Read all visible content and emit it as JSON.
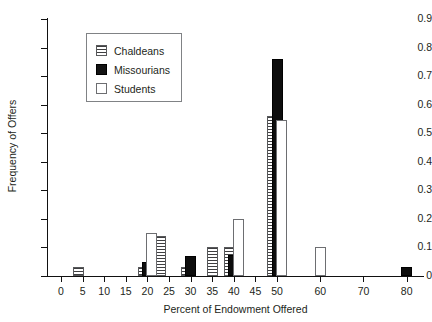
{
  "chart_data": {
    "type": "bar",
    "title": "",
    "subtitle": "",
    "xlabel": "Percent of Endowment Offered",
    "ylabel": "Frequency of Offers",
    "xlim": [
      -3,
      84
    ],
    "ylim": [
      0,
      0.9
    ],
    "grid": false,
    "legend_position": "upper-left-inside",
    "xticks": [
      0,
      5,
      10,
      15,
      20,
      25,
      30,
      35,
      40,
      45,
      50,
      60,
      70,
      80
    ],
    "xtick_labels": [
      "0",
      "5",
      "10",
      "15",
      "20",
      "25",
      "30",
      "35",
      "40",
      "45",
      "50",
      "60",
      "70",
      "80"
    ],
    "yticks": [
      0,
      0.1,
      0.2,
      0.3,
      0.4,
      0.5,
      0.6,
      0.7,
      0.8,
      0.9
    ],
    "ytick_labels": [
      "0",
      "0.1",
      "0.2",
      "0.3",
      "0.4",
      "0.5",
      "0.6",
      "0.7",
      "0.8",
      "0.9"
    ],
    "series": [
      {
        "name": "Chaldeans",
        "style": "horizontal-hatch",
        "color": "#ffffff",
        "points": [
          {
            "x": 4,
            "y": 0.03
          },
          {
            "x": 19,
            "y": 0.03
          },
          {
            "x": 23,
            "y": 0.14
          },
          {
            "x": 29,
            "y": 0.03
          },
          {
            "x": 35,
            "y": 0.1
          },
          {
            "x": 39,
            "y": 0.1
          },
          {
            "x": 49,
            "y": 0.56
          }
        ]
      },
      {
        "name": "Missourians",
        "style": "solid-black",
        "color": "#0d0d0d",
        "points": [
          {
            "x": 20,
            "y": 0.05
          },
          {
            "x": 30,
            "y": 0.07
          },
          {
            "x": 40,
            "y": 0.075
          },
          {
            "x": 50,
            "y": 0.76
          },
          {
            "x": 80,
            "y": 0.03
          }
        ]
      },
      {
        "name": "Students",
        "style": "open-white",
        "color": "#ffffff",
        "points": [
          {
            "x": 21,
            "y": 0.15
          },
          {
            "x": 41,
            "y": 0.2
          },
          {
            "x": 51,
            "y": 0.545
          },
          {
            "x": 60,
            "y": 0.1
          }
        ]
      }
    ]
  },
  "legend": {
    "entries": [
      {
        "label": "Chaldeans"
      },
      {
        "label": "Missourians"
      },
      {
        "label": "Students"
      }
    ]
  }
}
